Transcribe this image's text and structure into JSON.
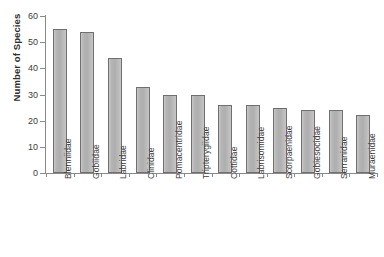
{
  "chart_data": {
    "type": "bar",
    "title": "",
    "xlabel": "",
    "ylabel": "Number of Species",
    "ylim": [
      0,
      60
    ],
    "yticks": [
      0,
      10,
      20,
      30,
      40,
      50,
      60
    ],
    "grid": false,
    "legend": false,
    "orientation": "vertical",
    "bar_fill_color": "#b5b5b5",
    "bar_border_color": "#6f6f6f",
    "axis_color": "#8a8a8a",
    "background_color": "#ffffff",
    "categories": [
      "Blenniidae",
      "Gobiidae",
      "Labridae",
      "Clinidae",
      "Pomacentridae",
      "Tripterygiidae",
      "Cottidae",
      "Labrisomidae",
      "Scorpaenidae",
      "Gobiesocidae",
      "Serranidae",
      "Muraenidae"
    ],
    "values": [
      55,
      54,
      44,
      33,
      30,
      30,
      26,
      26,
      25,
      24,
      24,
      22
    ]
  }
}
